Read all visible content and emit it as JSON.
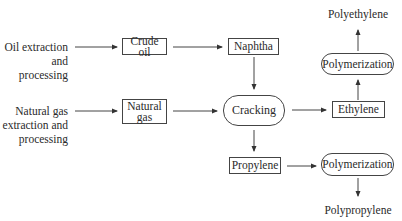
{
  "diagram": {
    "sources": {
      "oil": [
        "Oil extraction",
        "and",
        "processing"
      ],
      "gas": [
        "Natural gas",
        "extraction and",
        "processing"
      ]
    },
    "nodes": {
      "crude_oil": "Crude oil",
      "naphtha": "Naphtha",
      "natural_gas": [
        "Natural",
        "gas"
      ],
      "cracking": "Cracking",
      "ethylene": "Ethylene",
      "propylene": "Propylene",
      "polymerization_top": "Polymerization",
      "polymerization_bottom": "Polymerization"
    },
    "products": {
      "polyethylene": "Polyethylene",
      "polypropylene": "Polypropylene"
    },
    "colors": {
      "line": "#444444",
      "text": "#2a2a2a",
      "background": "#ffffff"
    }
  }
}
